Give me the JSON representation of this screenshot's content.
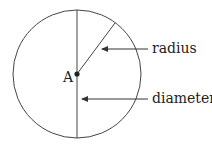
{
  "diagram": {
    "center_label": "A",
    "labels": {
      "radius": "radius",
      "diameter": "diameter"
    },
    "colors": {
      "stroke": "#444444",
      "text": "#222222",
      "background": "#ffffff"
    }
  }
}
